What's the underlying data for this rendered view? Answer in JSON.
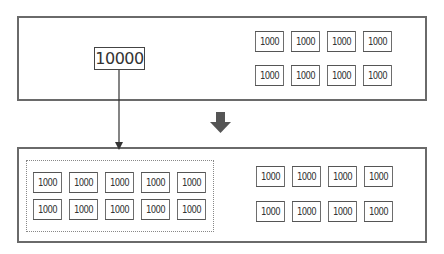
{
  "diagram": {
    "before": {
      "large_block": {
        "label": "10000"
      },
      "blocks": [
        "1000",
        "1000",
        "1000",
        "1000",
        "1000",
        "1000",
        "1000",
        "1000"
      ]
    },
    "after": {
      "split_group": [
        "1000",
        "1000",
        "1000",
        "1000",
        "1000",
        "1000",
        "1000",
        "1000",
        "1000",
        "1000"
      ],
      "blocks": [
        "1000",
        "1000",
        "1000",
        "1000",
        "1000",
        "1000",
        "1000",
        "1000"
      ]
    },
    "transition_arrow": "down-arrow",
    "colors": {
      "border": "#6a6a6a",
      "arrow": "#555555",
      "text": "#333333"
    }
  }
}
